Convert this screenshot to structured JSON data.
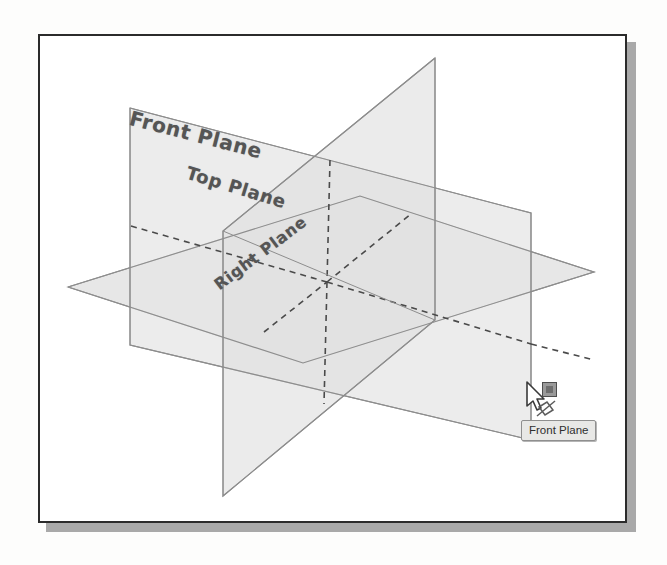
{
  "figure": {
    "frame": {
      "border_color": "#2b2b2b",
      "shadow_color": "#a9a9a9",
      "background": "#ffffff",
      "x": 38,
      "y": 34,
      "width": 589,
      "height": 489
    },
    "planes": [
      {
        "name": "Front Plane",
        "label": "Front Plane",
        "orientation": "vertical-frontal",
        "fill": "#e4e4e4",
        "stroke": "#8a8a8a",
        "label_rotation_deg": 14.5
      },
      {
        "name": "Top Plane",
        "label": "Top Plane",
        "orientation": "horizontal",
        "fill": "#e0e0e0",
        "stroke": "#8a8a8a",
        "label_rotation_deg": 17
      },
      {
        "name": "Right Plane",
        "label": "Right Plane",
        "orientation": "vertical-sagittal",
        "fill": "#dcdcdc",
        "stroke": "#8a8a8a",
        "label_rotation_deg": -37
      }
    ],
    "hidden_edges": {
      "style": "dashed",
      "color": "#4a4a4a",
      "dash_pattern": "6 5"
    }
  },
  "cursor": {
    "name": "select-cursor",
    "x": 527,
    "y": 386,
    "badge_icon": "selection-badge-icon",
    "entity_icon": "plane-icon"
  },
  "tooltip": {
    "name": "hover-tooltip",
    "text": "Front Plane",
    "background": "#e8e8e6",
    "border_color": "#8f8f8f",
    "text_color": "#2f2f2f",
    "x": 521,
    "y": 420
  }
}
